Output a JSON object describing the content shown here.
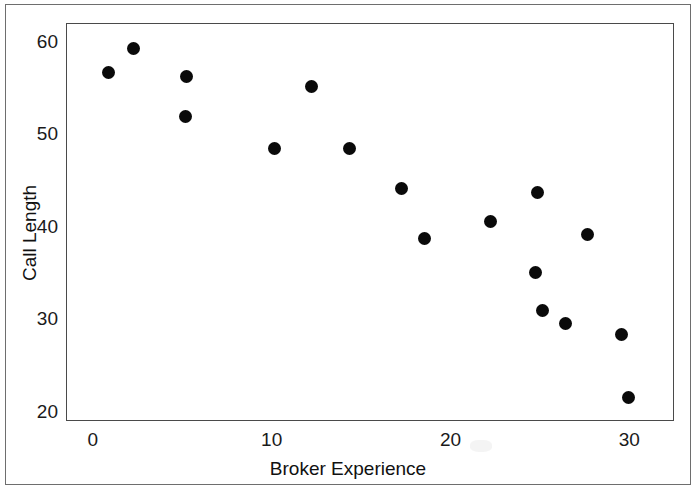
{
  "chart_data": {
    "type": "scatter",
    "title": "",
    "xlabel": "Broker Experience",
    "ylabel": "Call Length",
    "xlim": [
      -1.5,
      32.5
    ],
    "ylim": [
      19.0,
      62.0
    ],
    "xticks": [
      0,
      10,
      20,
      30
    ],
    "xtick_labels": [
      "0",
      "10",
      "20",
      "30"
    ],
    "yticks": [
      20,
      30,
      40,
      50,
      60
    ],
    "ytick_labels": [
      "20",
      "30",
      "40",
      "50",
      "60"
    ],
    "grid": false,
    "legend": null,
    "marker": {
      "shape": "circle",
      "color": "#0a0a0a",
      "size_px": 13
    },
    "series": [
      {
        "name": "Brokers",
        "points": [
          {
            "x": 0.8,
            "y": 56.8
          },
          {
            "x": 2.2,
            "y": 59.4
          },
          {
            "x": 5.2,
            "y": 56.3
          },
          {
            "x": 5.1,
            "y": 52.0
          },
          {
            "x": 10.1,
            "y": 48.6
          },
          {
            "x": 12.2,
            "y": 55.2
          },
          {
            "x": 14.3,
            "y": 48.6
          },
          {
            "x": 17.2,
            "y": 44.2
          },
          {
            "x": 18.5,
            "y": 38.8
          },
          {
            "x": 22.2,
            "y": 40.7
          },
          {
            "x": 24.8,
            "y": 43.8
          },
          {
            "x": 24.7,
            "y": 35.2
          },
          {
            "x": 25.1,
            "y": 31.0
          },
          {
            "x": 26.4,
            "y": 29.6
          },
          {
            "x": 27.6,
            "y": 39.3
          },
          {
            "x": 29.5,
            "y": 28.4
          },
          {
            "x": 29.9,
            "y": 21.7
          }
        ]
      }
    ]
  },
  "figure": {
    "axis_label_x": "Broker Experience",
    "axis_label_y": "Call Length",
    "frame_color": "#6e6e6e",
    "axis_color": "#4a4a4a",
    "background": "#ffffff"
  }
}
